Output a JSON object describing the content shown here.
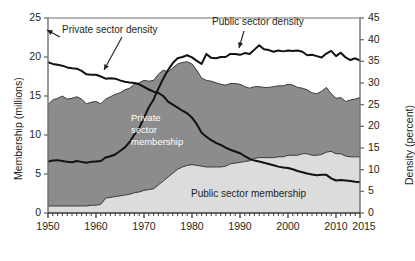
{
  "chart_data": {
    "type": "area",
    "title": "",
    "subtitle": "",
    "xlabel": "",
    "ylabel": "Membership (millions)",
    "y2label": "Density (percent)",
    "xlim": [
      1950,
      2015
    ],
    "ylim": [
      0,
      25
    ],
    "y2lim": [
      0,
      45
    ],
    "grid": false,
    "legend_position": "inline-annotations",
    "x_ticks": [
      "1950",
      "1960",
      "1970",
      "1980",
      "1990",
      "2000",
      "2010",
      "2015"
    ],
    "x_tick_values": [
      1950,
      1960,
      1970,
      1980,
      1990,
      2000,
      2010,
      2015
    ],
    "y_ticks": [
      "0",
      "5",
      "10",
      "15",
      "20",
      "25"
    ],
    "y_tick_values": [
      0,
      5,
      10,
      15,
      20,
      25
    ],
    "y2_ticks": [
      "0",
      "5",
      "10",
      "15",
      "20",
      "25",
      "30",
      "35",
      "40",
      "45"
    ],
    "y2_tick_values": [
      0,
      5,
      10,
      15,
      20,
      25,
      30,
      35,
      40,
      45
    ],
    "x": [
      1950,
      1951,
      1952,
      1953,
      1954,
      1955,
      1956,
      1957,
      1958,
      1959,
      1960,
      1961,
      1962,
      1963,
      1964,
      1965,
      1966,
      1967,
      1968,
      1969,
      1970,
      1971,
      1972,
      1973,
      1974,
      1975,
      1976,
      1977,
      1978,
      1979,
      1980,
      1981,
      1982,
      1983,
      1984,
      1985,
      1986,
      1987,
      1988,
      1989,
      1990,
      1991,
      1992,
      1993,
      1994,
      1995,
      1996,
      1997,
      1998,
      1999,
      2000,
      2001,
      2002,
      2003,
      2004,
      2005,
      2006,
      2007,
      2008,
      2009,
      2010,
      2011,
      2012,
      2013,
      2014,
      2015
    ],
    "series": [
      {
        "name": "Public sector membership",
        "axis": "left",
        "unit": "millions",
        "fill": "#dcdcdc",
        "stack_order": 1,
        "values": [
          0.9,
          0.9,
          0.9,
          0.9,
          0.9,
          0.9,
          0.9,
          0.9,
          0.9,
          1.0,
          1.0,
          1.1,
          1.9,
          2.0,
          2.1,
          2.2,
          2.3,
          2.4,
          2.6,
          2.7,
          2.9,
          3.0,
          3.1,
          3.6,
          4.1,
          4.6,
          5.1,
          5.6,
          5.9,
          6.1,
          6.2,
          6.1,
          6.0,
          5.9,
          5.9,
          5.9,
          5.9,
          6.0,
          6.3,
          6.4,
          6.5,
          6.6,
          6.7,
          7.0,
          7.1,
          7.1,
          7.1,
          7.1,
          7.2,
          7.2,
          7.4,
          7.4,
          7.4,
          7.6,
          7.6,
          7.4,
          7.4,
          7.5,
          7.8,
          7.9,
          7.6,
          7.6,
          7.3,
          7.2,
          7.2,
          7.2
        ]
      },
      {
        "name": "Private sector membership",
        "axis": "left",
        "unit": "millions",
        "fill": "#8c8c8c",
        "stack_order": 2,
        "values": [
          13.0,
          13.6,
          13.8,
          14.1,
          13.7,
          13.8,
          14.0,
          13.7,
          13.1,
          13.2,
          13.3,
          12.9,
          12.7,
          12.9,
          13.1,
          13.2,
          13.5,
          13.6,
          13.9,
          14.0,
          14.1,
          13.9,
          13.9,
          14.2,
          14.2,
          13.5,
          13.5,
          13.5,
          13.4,
          13.3,
          12.9,
          12.2,
          11.3,
          11.1,
          11.0,
          10.8,
          10.6,
          10.4,
          10.3,
          10.2,
          10.0,
          9.6,
          9.3,
          9.2,
          9.1,
          9.0,
          9.0,
          9.1,
          9.1,
          9.1,
          9.1,
          9.0,
          8.7,
          8.4,
          8.2,
          8.0,
          7.9,
          8.1,
          8.3,
          7.4,
          7.1,
          7.2,
          7.0,
          7.3,
          7.4,
          7.6
        ]
      },
      {
        "name": "Private sector density",
        "axis": "right",
        "unit": "percent",
        "stroke": "#111111",
        "values": [
          34.8,
          34.4,
          34.2,
          34.0,
          33.6,
          33.4,
          33.3,
          32.8,
          32.0,
          31.9,
          31.9,
          31.5,
          31.0,
          31.1,
          31.0,
          30.6,
          30.3,
          30.1,
          30.0,
          29.7,
          29.1,
          28.5,
          28.0,
          27.7,
          27.0,
          25.7,
          25.0,
          24.3,
          23.6,
          23.0,
          22.0,
          20.5,
          18.5,
          17.6,
          16.8,
          16.2,
          15.7,
          15.1,
          14.6,
          14.2,
          13.8,
          13.1,
          12.5,
          12.1,
          11.9,
          11.6,
          11.3,
          11.0,
          10.7,
          10.5,
          10.4,
          10.1,
          9.7,
          9.4,
          9.1,
          8.9,
          8.7,
          8.8,
          8.8,
          8.0,
          7.5,
          7.6,
          7.5,
          7.4,
          7.2,
          7.1
        ]
      },
      {
        "name": "Public sector density",
        "axis": "right",
        "unit": "percent",
        "stroke": "#111111",
        "values": [
          11.9,
          12.1,
          12.2,
          12.0,
          11.8,
          11.7,
          12.0,
          11.8,
          11.6,
          11.8,
          11.9,
          12.0,
          12.8,
          13.1,
          13.5,
          14.3,
          15.1,
          16.4,
          18.1,
          19.6,
          22.0,
          24.4,
          26.2,
          28.7,
          31.0,
          33.0,
          34.6,
          35.7,
          36.0,
          36.4,
          35.9,
          35.1,
          34.4,
          36.7,
          35.8,
          35.7,
          36.0,
          36.0,
          36.7,
          36.7,
          36.5,
          36.9,
          36.7,
          37.7,
          38.7,
          37.8,
          37.6,
          37.2,
          37.5,
          37.3,
          37.5,
          37.4,
          37.5,
          37.2,
          36.4,
          36.5,
          36.2,
          35.9,
          36.8,
          37.4,
          36.2,
          37.0,
          35.9,
          35.3,
          35.7,
          35.2
        ]
      }
    ],
    "annotations": [
      {
        "name": "private-sector-density-label",
        "text": "Private sector density",
        "x_px": 62,
        "y_px": 30,
        "color": "#231f20"
      },
      {
        "name": "public-sector-density-label",
        "text": "Public sector density",
        "x_px": 212,
        "y_px": 22,
        "color": "#231f20"
      },
      {
        "name": "private-sector-membership-label",
        "text": "Private\nsector\nmembership",
        "x_px": 131,
        "y_px": 116,
        "color": "#ffffff"
      },
      {
        "name": "public-sector-membership-label",
        "text": "Public sector membership",
        "x_px": 191,
        "y_px": 194,
        "color": "#231f20"
      }
    ]
  }
}
